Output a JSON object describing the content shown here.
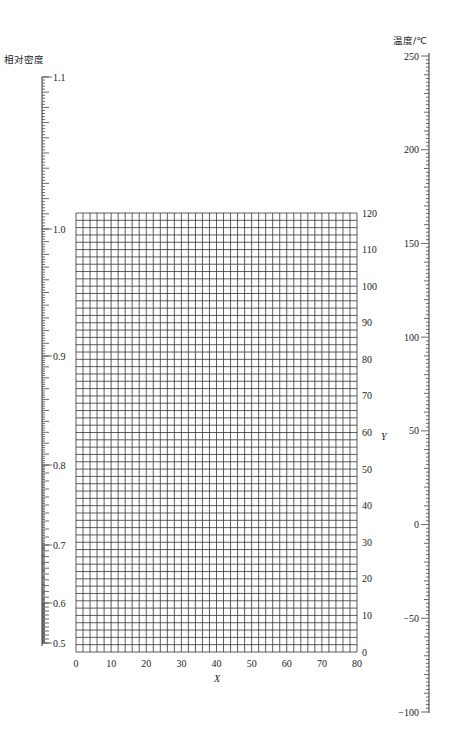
{
  "chart_data": {
    "type": "nomogram",
    "title": "",
    "density_scale": {
      "label": "相对密度",
      "ticks": [
        {
          "value": 1.1,
          "label": "1.1",
          "y": 77
        },
        {
          "value": 1.0,
          "label": "1.0",
          "y": 229
        },
        {
          "value": 0.9,
          "label": "0.9",
          "y": 356
        },
        {
          "value": 0.8,
          "label": "0.8",
          "y": 465
        },
        {
          "value": 0.7,
          "label": "0.7",
          "y": 545
        },
        {
          "value": 0.6,
          "label": "0.6",
          "y": 603
        },
        {
          "value": 0.5,
          "label": "0.5",
          "y": 643
        }
      ],
      "range": [
        0.5,
        1.1
      ],
      "minor_step": 0.002,
      "scale": "non-linear"
    },
    "grid": {
      "xlabel": "X",
      "ylabel": "Y",
      "xlim": [
        0,
        80
      ],
      "ylim": [
        0,
        120
      ],
      "x_ticks": [
        "0",
        "10",
        "20",
        "30",
        "40",
        "50",
        "60",
        "70",
        "80"
      ],
      "y_ticks": [
        "0",
        "10",
        "20",
        "30",
        "40",
        "50",
        "60",
        "70",
        "80",
        "90",
        "100",
        "110",
        "120"
      ],
      "x_step": 2,
      "y_step": 2,
      "grid": true
    },
    "temperature_scale": {
      "label": "温度/℃",
      "range": [
        -100,
        250
      ],
      "ticks": [
        "250",
        "200",
        "150",
        "100",
        "50",
        "0",
        "-50",
        "-100"
      ],
      "minor_step": 2,
      "major_step": 10,
      "scale": "linear"
    }
  }
}
